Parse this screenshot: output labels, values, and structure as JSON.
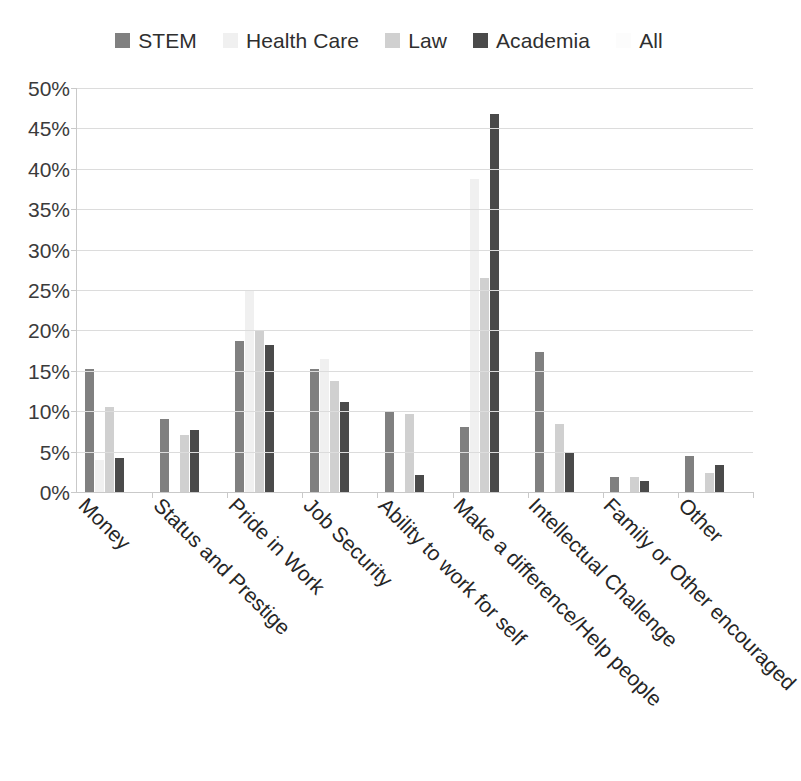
{
  "legend": {
    "position": "top-center",
    "items": [
      {
        "label": "STEM",
        "color": "#808080"
      },
      {
        "label": "Health Care",
        "color": "#f0f0f0"
      },
      {
        "label": "Law",
        "color": "#d0d0d0"
      },
      {
        "label": "Academia",
        "color": "#4a4a4a"
      },
      {
        "label": "All",
        "color": "#fcfcfc"
      }
    ]
  },
  "axis": {
    "y_ticks": [
      "0%",
      "5%",
      "10%",
      "15%",
      "20%",
      "25%",
      "30%",
      "35%",
      "40%",
      "45%",
      "50%"
    ],
    "y_min": 0,
    "y_max": 50,
    "grid": true
  },
  "chart_data": {
    "type": "bar",
    "title": "",
    "subtitle": "",
    "xlabel": "",
    "ylabel": "",
    "ylim": [
      0,
      50
    ],
    "ytick_format": "percent",
    "ytick_step": 5,
    "grid": true,
    "legend_position": "top-center",
    "categories": [
      "Money",
      "Status and Prestige",
      "Pride in Work",
      "Job Security",
      "Ability to work for self",
      "Make a difference/Help people",
      "Intellectual Challenge",
      "Family or Other encouraged",
      "Other"
    ],
    "series": [
      {
        "name": "STEM",
        "color": "#808080",
        "values": [
          15.2,
          9.0,
          18.7,
          15.2,
          10.0,
          8.0,
          17.3,
          1.9,
          4.4
        ]
      },
      {
        "name": "Health Care",
        "color": "#f0f0f0",
        "values": [
          4.0,
          0.0,
          25.0,
          16.5,
          0.0,
          38.7,
          0.0,
          0.0,
          0.0
        ]
      },
      {
        "name": "Law",
        "color": "#d0d0d0",
        "values": [
          10.5,
          7.0,
          20.0,
          13.8,
          9.6,
          26.5,
          8.4,
          1.9,
          2.3
        ]
      },
      {
        "name": "Academia",
        "color": "#4a4a4a",
        "values": [
          4.2,
          7.7,
          18.2,
          11.2,
          2.1,
          46.8,
          4.9,
          1.4,
          3.4
        ]
      },
      {
        "name": "All",
        "color": "#fcfcfc",
        "values": [
          0.0,
          0.0,
          0.0,
          0.0,
          0.0,
          0.0,
          0.0,
          0.0,
          0.0
        ]
      }
    ]
  }
}
